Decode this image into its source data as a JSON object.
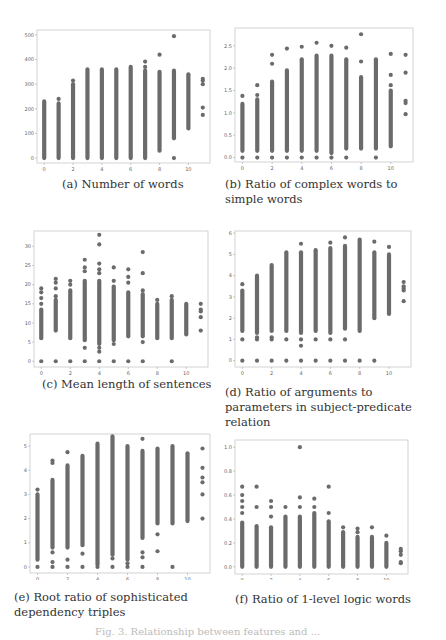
{
  "figure_caption": "Fig. 3. Relationship between features and ...",
  "chart_data": [
    {
      "id": "a",
      "type": "scatter",
      "caption": "(a) Number of words",
      "xlabel": "",
      "ylabel": "",
      "xticks": [
        0,
        2,
        4,
        6,
        8,
        10
      ],
      "yticks": [
        0,
        100,
        200,
        300,
        400,
        500
      ],
      "xlim": [
        -0.5,
        11.5
      ],
      "ylim": [
        -20,
        520
      ],
      "columns": [
        {
          "x": 0,
          "min": 0,
          "max": 230,
          "outliers": []
        },
        {
          "x": 1,
          "min": 0,
          "max": 222,
          "outliers": [
            240
          ]
        },
        {
          "x": 2,
          "min": 0,
          "max": 300,
          "outliers": [
            315
          ]
        },
        {
          "x": 3,
          "min": 0,
          "max": 360,
          "outliers": []
        },
        {
          "x": 4,
          "min": 0,
          "max": 360,
          "outliers": []
        },
        {
          "x": 5,
          "min": 0,
          "max": 360,
          "outliers": []
        },
        {
          "x": 6,
          "min": 0,
          "max": 370,
          "outliers": []
        },
        {
          "x": 7,
          "min": 0,
          "max": 355,
          "outliers": [
            370,
            392
          ]
        },
        {
          "x": 8,
          "min": 30,
          "max": 350,
          "outliers": [
            420
          ]
        },
        {
          "x": 9,
          "min": 80,
          "max": 355,
          "outliers": [
            0,
            495
          ]
        },
        {
          "x": 10,
          "min": 120,
          "max": 340,
          "outliers": []
        },
        {
          "x": 11,
          "min": 175,
          "max": 175,
          "outliers": [
            205,
            300,
            315,
            322
          ]
        }
      ]
    },
    {
      "id": "b",
      "type": "scatter",
      "caption": "(b) Ratio of complex words to simple words",
      "xlabel": "",
      "ylabel": "",
      "xticks": [
        0,
        2,
        4,
        6,
        8,
        10
      ],
      "yticks": [
        0.0,
        0.5,
        1.0,
        1.5,
        2.0,
        2.5
      ],
      "xlim": [
        -0.5,
        11.5
      ],
      "ylim": [
        -0.1,
        2.9
      ],
      "columns": [
        {
          "x": 0,
          "min": 0.15,
          "max": 1.2,
          "outliers": [
            0.0,
            1.38
          ]
        },
        {
          "x": 1,
          "min": 0.15,
          "max": 1.3,
          "outliers": [
            0.0,
            1.4,
            1.62
          ]
        },
        {
          "x": 2,
          "min": 0.15,
          "max": 1.7,
          "outliers": [
            0.0,
            2.1,
            2.3
          ]
        },
        {
          "x": 3,
          "min": 0.15,
          "max": 1.95,
          "outliers": [
            0.0,
            2.44
          ]
        },
        {
          "x": 4,
          "min": 0.15,
          "max": 2.2,
          "outliers": [
            0.0,
            2.48
          ]
        },
        {
          "x": 5,
          "min": 0.15,
          "max": 2.28,
          "outliers": [
            0.0,
            2.57
          ]
        },
        {
          "x": 6,
          "min": 0.1,
          "max": 2.28,
          "outliers": [
            0.0,
            2.5
          ]
        },
        {
          "x": 7,
          "min": 0.2,
          "max": 2.2,
          "outliers": [
            0.0,
            2.46
          ]
        },
        {
          "x": 8,
          "min": 0.2,
          "max": 1.8,
          "outliers": [
            2.15,
            2.76
          ]
        },
        {
          "x": 9,
          "min": 0.2,
          "max": 2.2,
          "outliers": [
            0.0
          ]
        },
        {
          "x": 10,
          "min": 0.25,
          "max": 1.5,
          "outliers": [
            1.62,
            1.85,
            2.32
          ]
        },
        {
          "x": 11,
          "min": 0.97,
          "max": 0.97,
          "outliers": [
            1.22,
            1.27,
            1.9,
            2.3
          ]
        }
      ]
    },
    {
      "id": "c",
      "type": "scatter",
      "caption": "(c) Mean length of sentences",
      "xlabel": "",
      "ylabel": "",
      "xticks": [
        0,
        2,
        4,
        6,
        8,
        10
      ],
      "yticks": [
        0,
        5,
        10,
        15,
        20,
        25,
        30
      ],
      "xlim": [
        -0.5,
        11.5
      ],
      "ylim": [
        -1.5,
        34
      ],
      "columns": [
        {
          "x": 0,
          "min": 6,
          "max": 13.5,
          "outliers": [
            0,
            15,
            16.5,
            18,
            19
          ]
        },
        {
          "x": 1,
          "min": 8,
          "max": 16,
          "outliers": [
            0,
            17,
            19,
            20.5,
            21.5
          ]
        },
        {
          "x": 2,
          "min": 6,
          "max": 18.5,
          "outliers": [
            0,
            20,
            21
          ]
        },
        {
          "x": 3,
          "min": 5.5,
          "max": 21,
          "outliers": [
            0,
            3.5,
            23.5,
            24.5,
            26.5
          ]
        },
        {
          "x": 4,
          "min": 4.5,
          "max": 21,
          "outliers": [
            0,
            2.5,
            3.5,
            23,
            24,
            25.5,
            30.5,
            33
          ]
        },
        {
          "x": 5,
          "min": 5.5,
          "max": 19.5,
          "outliers": [
            0,
            4.5,
            21,
            24.5
          ]
        },
        {
          "x": 6,
          "min": 6.5,
          "max": 18,
          "outliers": [
            0,
            20.5,
            22,
            24
          ]
        },
        {
          "x": 7,
          "min": 6.5,
          "max": 17.5,
          "outliers": [
            0,
            5,
            18.5,
            23,
            28.5
          ]
        },
        {
          "x": 8,
          "min": 6,
          "max": 15,
          "outliers": [
            16
          ]
        },
        {
          "x": 9,
          "min": 6,
          "max": 16,
          "outliers": [
            0,
            17
          ]
        },
        {
          "x": 10,
          "min": 7,
          "max": 15,
          "outliers": []
        },
        {
          "x": 11,
          "min": 8,
          "max": 8,
          "outliers": [
            11.5,
            13,
            13.5,
            15
          ]
        }
      ]
    },
    {
      "id": "d",
      "type": "scatter",
      "caption": "(d) Ratio of arguments to parameters in subject-predicate relation",
      "xlabel": "",
      "ylabel": "",
      "xticks": [
        0,
        2,
        4,
        6,
        8,
        10
      ],
      "yticks": [
        0,
        1,
        2,
        3,
        4,
        5,
        6
      ],
      "xlim": [
        -0.5,
        11.5
      ],
      "ylim": [
        -0.3,
        6.1
      ],
      "columns": [
        {
          "x": 0,
          "min": 1.4,
          "max": 3.3,
          "outliers": [
            0,
            1.0,
            3.6
          ]
        },
        {
          "x": 1,
          "min": 1.3,
          "max": 4.0,
          "outliers": [
            0,
            1.0,
            1.1
          ]
        },
        {
          "x": 2,
          "min": 1.4,
          "max": 4.5,
          "outliers": [
            0,
            1.0,
            1.1
          ]
        },
        {
          "x": 3,
          "min": 1.4,
          "max": 5.1,
          "outliers": [
            0,
            1.0
          ]
        },
        {
          "x": 4,
          "min": 1.3,
          "max": 5.1,
          "outliers": [
            0,
            0.7,
            1.0,
            5.5
          ]
        },
        {
          "x": 5,
          "min": 1.4,
          "max": 5.2,
          "outliers": [
            0,
            1.0
          ]
        },
        {
          "x": 6,
          "min": 1.3,
          "max": 5.3,
          "outliers": [
            0,
            1.0,
            5.55
          ]
        },
        {
          "x": 7,
          "min": 1.5,
          "max": 5.4,
          "outliers": [
            0,
            1.0,
            5.8
          ]
        },
        {
          "x": 8,
          "min": 1.4,
          "max": 5.7,
          "outliers": [
            0
          ]
        },
        {
          "x": 9,
          "min": 2.0,
          "max": 5.1,
          "outliers": [
            0,
            5.6
          ]
        },
        {
          "x": 10,
          "min": 2.2,
          "max": 5.0,
          "outliers": [
            5.35
          ]
        },
        {
          "x": 11,
          "min": 2.8,
          "max": 2.8,
          "outliers": [
            3.3,
            3.4,
            3.5,
            3.7
          ]
        }
      ]
    },
    {
      "id": "e",
      "type": "scatter",
      "caption": "(e) Root ratio of sophisticated dependency triples",
      "xlabel": "",
      "ylabel": "",
      "xticks": [
        0,
        2,
        4,
        6,
        8,
        10
      ],
      "yticks": [
        0,
        1,
        2,
        3,
        4,
        5
      ],
      "xlim": [
        -0.5,
        11.5
      ],
      "ylim": [
        -0.25,
        5.5
      ],
      "columns": [
        {
          "x": 0,
          "min": 0.3,
          "max": 3.0,
          "outliers": [
            0,
            3.2
          ]
        },
        {
          "x": 1,
          "min": 0.8,
          "max": 3.6,
          "outliers": [
            0,
            0.2,
            0.6,
            4.3,
            4.4
          ]
        },
        {
          "x": 2,
          "min": 0.8,
          "max": 4.2,
          "outliers": [
            0,
            0.3,
            4.75
          ]
        },
        {
          "x": 3,
          "min": 0.9,
          "max": 4.6,
          "outliers": [
            0,
            0.55
          ]
        },
        {
          "x": 4,
          "min": 0.1,
          "max": 5.1,
          "outliers": [
            0
          ]
        },
        {
          "x": 5,
          "min": 0.5,
          "max": 5.4,
          "outliers": [
            0,
            0.35
          ]
        },
        {
          "x": 6,
          "min": 0.3,
          "max": 5.0,
          "outliers": [
            0,
            0.15
          ]
        },
        {
          "x": 7,
          "min": 1.2,
          "max": 4.8,
          "outliers": [
            0,
            0.4,
            0.6,
            5.3
          ]
        },
        {
          "x": 8,
          "min": 1.8,
          "max": 4.9,
          "outliers": [
            0.65,
            1.35
          ]
        },
        {
          "x": 9,
          "min": 1.8,
          "max": 5.0,
          "outliers": [
            0
          ]
        },
        {
          "x": 10,
          "min": 1.9,
          "max": 4.7,
          "outliers": []
        },
        {
          "x": 11,
          "min": 2.0,
          "max": 2.0,
          "outliers": [
            3.0,
            3.5,
            3.7,
            4.1,
            4.9
          ]
        }
      ]
    },
    {
      "id": "f",
      "type": "scatter",
      "caption": "(f) Ratio of 1-level logic words",
      "xlabel": "",
      "ylabel": "",
      "xticks": [
        0,
        2,
        4,
        6,
        8,
        10
      ],
      "yticks": [
        0.0,
        0.2,
        0.4,
        0.6,
        0.8,
        1.0
      ],
      "xlim": [
        -0.5,
        11.5
      ],
      "ylim": [
        -0.06,
        1.06
      ],
      "columns": [
        {
          "x": 0,
          "min": 0.0,
          "max": 0.37,
          "outliers": [
            0.45,
            0.5,
            0.55,
            0.6,
            0.67
          ]
        },
        {
          "x": 1,
          "min": 0.0,
          "max": 0.34,
          "outliers": [
            0.5,
            0.67
          ]
        },
        {
          "x": 2,
          "min": 0.0,
          "max": 0.33,
          "outliers": [
            0.42,
            0.5,
            0.55
          ]
        },
        {
          "x": 3,
          "min": 0.0,
          "max": 0.42,
          "outliers": [
            0.5
          ]
        },
        {
          "x": 4,
          "min": 0.0,
          "max": 0.42,
          "outliers": [
            0.5,
            0.58,
            1.0
          ]
        },
        {
          "x": 5,
          "min": 0.0,
          "max": 0.45,
          "outliers": [
            0.5,
            0.57
          ]
        },
        {
          "x": 6,
          "min": 0.0,
          "max": 0.38,
          "outliers": [
            0.45,
            0.67
          ]
        },
        {
          "x": 7,
          "min": 0.0,
          "max": 0.29,
          "outliers": [
            0.33
          ]
        },
        {
          "x": 8,
          "min": 0.0,
          "max": 0.25,
          "outliers": [
            0.29,
            0.32
          ]
        },
        {
          "x": 9,
          "min": 0.0,
          "max": 0.25,
          "outliers": [
            0.33
          ]
        },
        {
          "x": 10,
          "min": 0.0,
          "max": 0.2,
          "outliers": [
            0.26
          ]
        },
        {
          "x": 11,
          "min": 0.03,
          "max": 0.03,
          "outliers": [
            0.04,
            0.1,
            0.13,
            0.15
          ]
        }
      ]
    }
  ]
}
